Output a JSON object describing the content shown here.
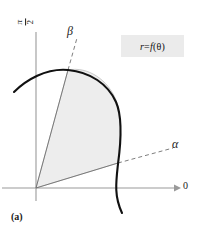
{
  "figure": {
    "caption": "(a)",
    "equation_label": "r = f(θ)",
    "equation_parts": {
      "r": "r",
      "equals": "=",
      "f": "f",
      "open": "(",
      "theta": "θ",
      "close": ")"
    },
    "axis_vertical_label_numerator": "π",
    "axis_vertical_label_denominator": "2",
    "axis_horizontal_label": "0",
    "ray_upper_label": "β",
    "ray_lower_label": "α",
    "colors": {
      "curve": "#111111",
      "axis": "#9a9a9a",
      "ray": "#6f6f6f",
      "shading": "#ededed",
      "shading_edge": "#b5b5b5",
      "equation_box_background": "#ebebeb",
      "text": "#1a1a1a"
    },
    "geometry": {
      "origin_x": 36,
      "origin_y": 188,
      "vertical_axis_top_y": 32,
      "horizontal_axis_right_x": 179,
      "beta_curve_intersection": [
        68,
        70
      ],
      "alpha_curve_intersection": [
        118,
        163
      ],
      "curve_left_endpoint": [
        15,
        92
      ],
      "curve_bottom_endpoint": [
        122,
        213
      ],
      "curve_max_right_x": 121
    }
  }
}
